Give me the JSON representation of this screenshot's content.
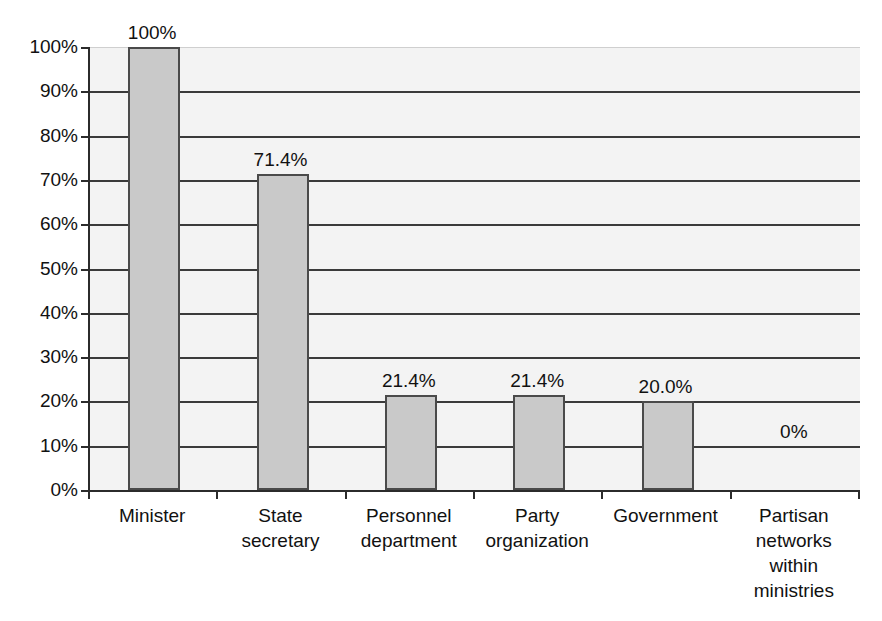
{
  "figure": {
    "title_remnant": ". . .",
    "background_color": "#ffffff",
    "plot_background_color": "#f3f3f3",
    "bar_fill_color": "#c9c9c9",
    "bar_border_color": "#4a4a4a",
    "axis_color": "#2b2b2b",
    "gridline_color": "#3a3a3a"
  },
  "chart_data": {
    "type": "bar",
    "title": "",
    "xlabel": "",
    "ylabel": "",
    "categories": [
      "Minister",
      "State secretary",
      "Personnel department",
      "Party organization",
      "Government",
      "Partisan networks within ministries"
    ],
    "category_lines": [
      [
        "Minister"
      ],
      [
        "State",
        "secretary"
      ],
      [
        "Personnel",
        "department"
      ],
      [
        "Party",
        "organization"
      ],
      [
        "Government"
      ],
      [
        "Partisan",
        "networks",
        "within",
        "ministries"
      ]
    ],
    "values": [
      100,
      71.4,
      21.4,
      21.4,
      20.0,
      0
    ],
    "data_labels": [
      "100%",
      "71.4%",
      "21.4%",
      "21.4%",
      "20.0%",
      "0%"
    ],
    "ylim": [
      0,
      100
    ],
    "ytick_values": [
      0,
      10,
      20,
      30,
      40,
      50,
      60,
      70,
      80,
      90,
      100
    ],
    "ytick_labels": [
      "0%",
      "10%",
      "20%",
      "30%",
      "40%",
      "50%",
      "60%",
      "70%",
      "80%",
      "90%",
      "100%"
    ],
    "grid": true,
    "grid_axis": "y",
    "legend": null,
    "legend_position": "none"
  }
}
